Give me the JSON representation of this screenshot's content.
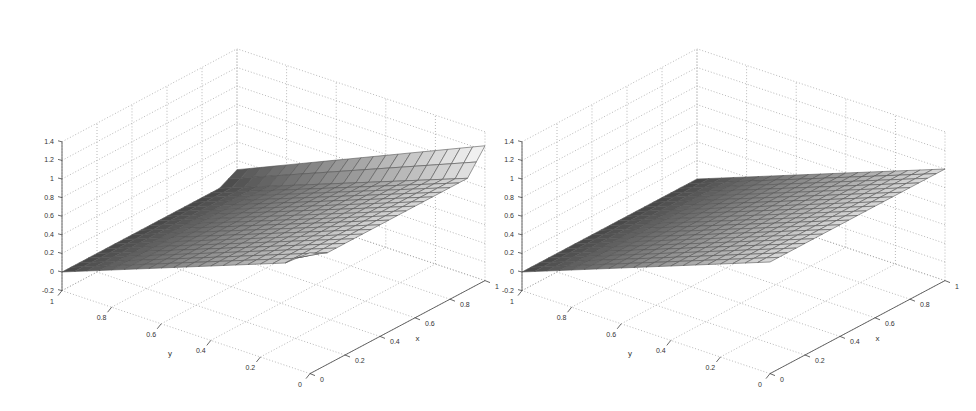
{
  "chart_data": [
    {
      "type": "surface",
      "title": "",
      "xlabel": "x",
      "ylabel": "y",
      "zlabel": "",
      "xlim": [
        0,
        1
      ],
      "ylim": [
        0,
        1
      ],
      "zlim": [
        -0.2,
        1.4
      ],
      "xticks": [
        "0",
        "0.2",
        "0.4",
        "0.6",
        "0.8",
        "1"
      ],
      "yticks": [
        "1",
        "0.8",
        "0.6",
        "0.4",
        "0.2",
        "0"
      ],
      "zticks": [
        "-0.2",
        "0",
        "0.2",
        "0.4",
        "0.6",
        "0.8",
        "1",
        "1.2",
        "1.4"
      ],
      "grid": true,
      "mesh_resolution": [
        20,
        20
      ],
      "colormap": "gray",
      "description": "Surface ramps linearly from z=0 at y=1 to z~1 at y=0; spurious overshoot bump along x=1 edge and near x=0,y=0 corner",
      "x": [
        0,
        0.2,
        0.4,
        0.6,
        0.8,
        1
      ],
      "y": [
        0,
        0.2,
        0.4,
        0.6,
        0.8,
        1
      ],
      "z_at_x0": [
        1.0,
        0.8,
        0.6,
        0.4,
        0.2,
        0.0
      ],
      "z_at_x1": [
        1.1,
        0.85,
        0.65,
        0.45,
        0.25,
        0.0
      ],
      "edge_overshoot": true
    },
    {
      "type": "surface",
      "title": "",
      "xlabel": "x",
      "ylabel": "y",
      "zlabel": "",
      "xlim": [
        0,
        1
      ],
      "ylim": [
        0,
        1
      ],
      "zlim": [
        -0.2,
        1.4
      ],
      "xticks": [
        "0",
        "0.2",
        "0.4",
        "0.6",
        "0.8",
        "1"
      ],
      "yticks": [
        "1",
        "0.8",
        "0.6",
        "0.4",
        "0.2",
        "0"
      ],
      "zticks": [
        "-0.2",
        "0",
        "0.2",
        "0.4",
        "0.6",
        "0.8",
        "1",
        "1.2",
        "1.4"
      ],
      "grid": true,
      "mesh_resolution": [
        20,
        20
      ],
      "colormap": "gray",
      "description": "Surface ramps linearly from z=0 at y=1 to z~1 at y=0; clean edge at x=1 with drop-off",
      "x": [
        0,
        0.2,
        0.4,
        0.6,
        0.8,
        1
      ],
      "y": [
        0,
        0.2,
        0.4,
        0.6,
        0.8,
        1
      ],
      "z_at_x0": [
        1.0,
        0.8,
        0.6,
        0.4,
        0.2,
        0.0
      ],
      "z_at_x1": [
        1.0,
        0.8,
        0.6,
        0.4,
        0.2,
        0.0
      ],
      "edge_overshoot": false
    }
  ],
  "plots": [
    {
      "offset_x": 0,
      "labels": {
        "x": "x",
        "y": "y"
      },
      "zticks": [
        "1.4",
        "1.2",
        "1",
        "0.8",
        "0.6",
        "0.4",
        "0.2",
        "0",
        "-0.2"
      ],
      "yticks": [
        "1",
        "0.8",
        "0.6",
        "0.4",
        "0.2",
        "0"
      ],
      "xticks": [
        "0",
        "0.2",
        "0.4",
        "0.6",
        "0.8",
        "1"
      ]
    },
    {
      "offset_x": 460,
      "labels": {
        "x": "x",
        "y": "y"
      },
      "zticks": [
        "1.4",
        "1.2",
        "1",
        "0.8",
        "0.6",
        "0.4",
        "0.2",
        "0",
        "-0.2"
      ],
      "yticks": [
        "1",
        "0.8",
        "0.6",
        "0.4",
        "0.2",
        "0"
      ],
      "xticks": [
        "0",
        "0.2",
        "0.4",
        "0.6",
        "0.8",
        "1"
      ]
    }
  ]
}
